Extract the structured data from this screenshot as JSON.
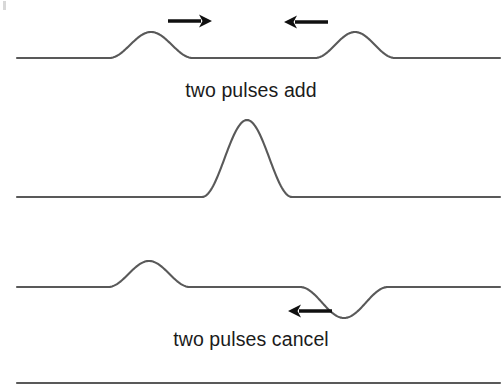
{
  "figure": {
    "background_color": "#ffffff",
    "line_color": "#595959",
    "arrow_color": "#101010",
    "text_color": "#1b1b1b"
  },
  "captions": {
    "add": "two pulses add",
    "cancel": "two pulses cancel"
  },
  "panels": [
    {
      "name": "top-panel-approaching-pulses",
      "baseline_y": 58,
      "pulses": [
        {
          "name": "left-crest",
          "polarity": "crest",
          "center_x": 151,
          "half_width": 42,
          "amplitude": 26,
          "direction": "right"
        },
        {
          "name": "right-crest",
          "polarity": "crest",
          "center_x": 355,
          "half_width": 40,
          "amplitude": 26,
          "direction": "left"
        }
      ],
      "arrows": [
        {
          "name": "right-arrow",
          "direction": "right",
          "x_start": 168,
          "x_end": 212,
          "y": 21
        },
        {
          "name": "left-arrow",
          "direction": "left",
          "x_start": 328,
          "x_end": 284,
          "y": 22
        }
      ]
    },
    {
      "name": "middle-panel-constructive-sum",
      "baseline_y": 197,
      "pulses": [
        {
          "name": "combined-crest",
          "polarity": "crest",
          "center_x": 247,
          "half_width": 45,
          "amplitude": 77,
          "direction": "none"
        }
      ],
      "arrows": []
    },
    {
      "name": "bottom-panel-opposite-pulses",
      "baseline_y": 287,
      "pulses": [
        {
          "name": "left-crest",
          "polarity": "crest",
          "center_x": 149,
          "half_width": 41,
          "amplitude": 26,
          "direction": "right"
        },
        {
          "name": "right-trough",
          "polarity": "trough",
          "center_x": 344,
          "half_width": 44,
          "amplitude": 31,
          "direction": "left"
        }
      ],
      "arrows": [
        {
          "name": "left-arrow",
          "direction": "left",
          "x_start": 332,
          "x_end": 288,
          "y": 311
        }
      ]
    }
  ],
  "baseline_rule": {
    "name": "bottom-rule",
    "y": 383,
    "x_start": 17,
    "x_end": 500
  },
  "geometry": {
    "line_start_x": 17,
    "line_end_x": 500
  }
}
